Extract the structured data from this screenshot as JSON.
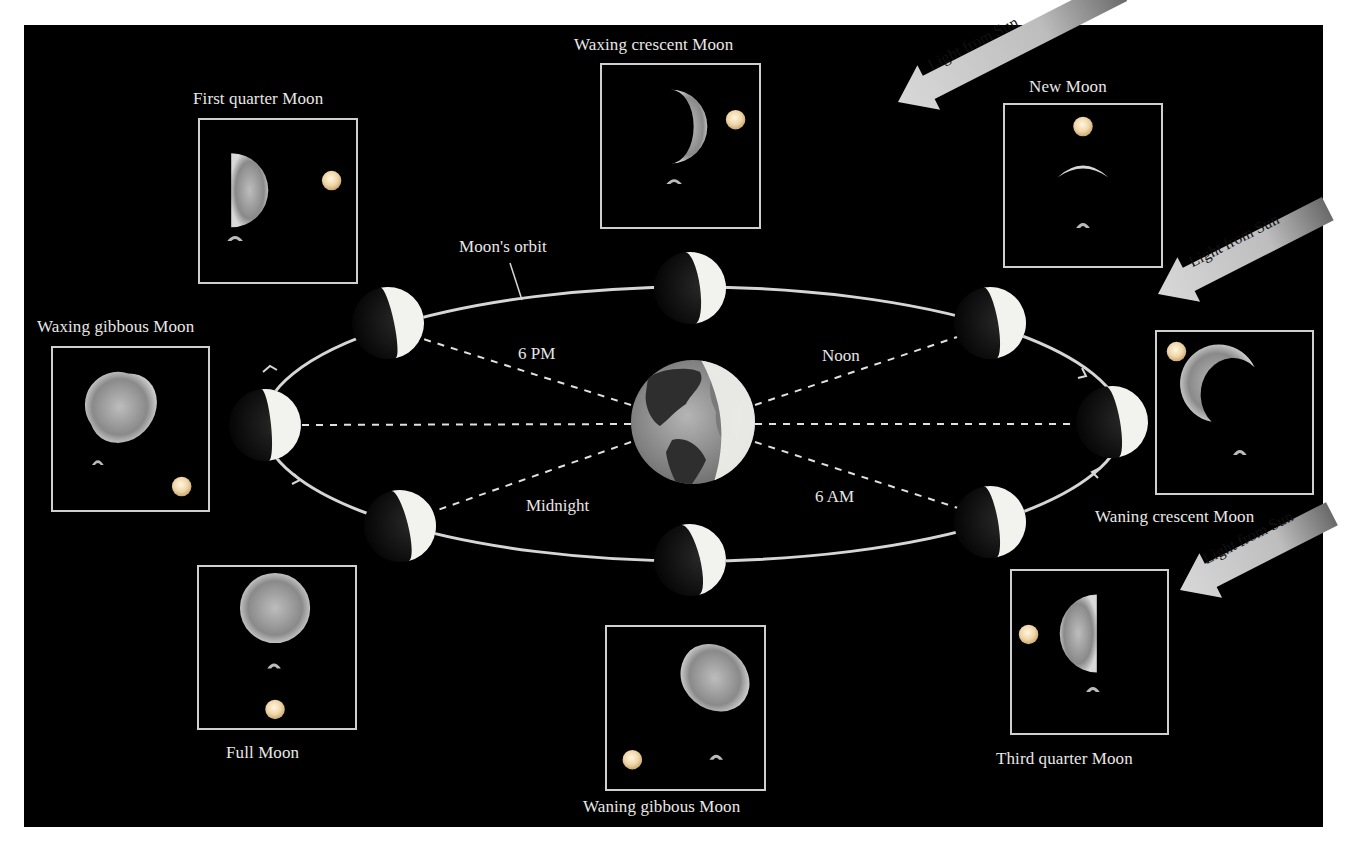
{
  "diagram": {
    "orbit_label": "Moon's orbit",
    "times": {
      "six_pm": "6 PM",
      "noon": "Noon",
      "midnight": "Midnight",
      "six_am": "6 AM"
    },
    "light_from_sun": [
      "Light from Sun",
      "Light from Sun",
      "Light from Sun"
    ],
    "phases": [
      {
        "id": "new",
        "label": "New Moon"
      },
      {
        "id": "waxing-crescent",
        "label": "Waxing crescent Moon"
      },
      {
        "id": "first-quarter",
        "label": "First quarter Moon"
      },
      {
        "id": "waxing-gibbous",
        "label": "Waxing gibbous Moon"
      },
      {
        "id": "full",
        "label": "Full Moon"
      },
      {
        "id": "waning-gibbous",
        "label": "Waning gibbous Moon"
      },
      {
        "id": "third-quarter",
        "label": "Third quarter Moon"
      },
      {
        "id": "waning-crescent",
        "label": "Waning crescent Moon"
      }
    ],
    "colors": {
      "background": "#000000",
      "frame": "#cfcfcf",
      "text": "#e8e8e8",
      "moon_lit": "#f2f2ee",
      "sun": "#f4e3c0"
    }
  }
}
